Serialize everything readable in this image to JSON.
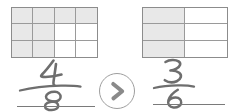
{
  "worksheet": {
    "type": "fraction-comparison",
    "title": "Compare the shaded fraction models",
    "background_color": "#ffffff",
    "shade_color": "#e8e8e8",
    "border_color": "#8c8c8c",
    "ink_color": "#6e6e6e"
  },
  "models": [
    {
      "position": "left",
      "columns": 4,
      "rows": 3,
      "total_cells": 12,
      "shaded_cells": 8,
      "shaded_map": [
        [
          true,
          true,
          true,
          true
        ],
        [
          true,
          true,
          false,
          false
        ],
        [
          true,
          true,
          false,
          false
        ]
      ]
    },
    {
      "position": "right",
      "columns": 2,
      "rows": 3,
      "total_cells": 6,
      "shaded_cells": 3,
      "shaded_map": [
        [
          true,
          false
        ],
        [
          true,
          false
        ],
        [
          true,
          false
        ]
      ]
    }
  ],
  "answers": [
    {
      "position": "left",
      "numerator": "4",
      "denominator": "8",
      "fraction_text": "4/8",
      "handwritten": true
    },
    {
      "position": "right",
      "numerator": "3",
      "denominator": "6",
      "fraction_text": "3/6",
      "handwritten": true
    }
  ],
  "operator": {
    "symbol": ">",
    "name": "greater-than",
    "shape": "circle"
  }
}
